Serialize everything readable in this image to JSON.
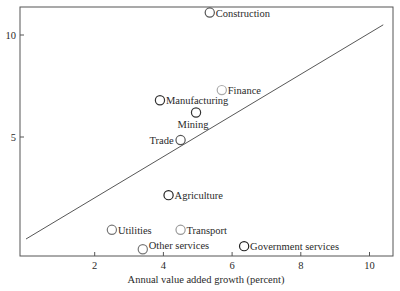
{
  "chart_data": {
    "type": "scatter",
    "title": "",
    "xlabel": "Annual value added growth (percent)",
    "ylabel": "",
    "xlim": [
      0,
      11
    ],
    "ylim": [
      -0.8,
      11.5
    ],
    "x_ticks": [
      2,
      4,
      6,
      8,
      10
    ],
    "y_ticks": [
      5,
      10
    ],
    "grid": false,
    "legend": null,
    "points": [
      {
        "label": "Construction",
        "x": 5.35,
        "y": 11.1,
        "shade": "#555555"
      },
      {
        "label": "Finance",
        "x": 5.7,
        "y": 7.3,
        "shade": "#aaaaaa"
      },
      {
        "label": "Manufacturing",
        "x": 3.9,
        "y": 6.8,
        "shade": "#333333"
      },
      {
        "label": "Mining",
        "x": 4.95,
        "y": 6.2,
        "shade": "#333333"
      },
      {
        "label": "Trade",
        "x": 4.5,
        "y": 4.85,
        "shade": "#555555"
      },
      {
        "label": "Agriculture",
        "x": 4.15,
        "y": 2.15,
        "shade": "#222222"
      },
      {
        "label": "Utilities",
        "x": 2.5,
        "y": 0.45,
        "shade": "#777777"
      },
      {
        "label": "Transport",
        "x": 4.5,
        "y": 0.45,
        "shade": "#999999"
      },
      {
        "label": "Other services",
        "x": 3.4,
        "y": -0.5,
        "shade": "#777777"
      },
      {
        "label": "Government services",
        "x": 6.35,
        "y": -0.35,
        "shade": "#222222"
      }
    ],
    "reference_line": {
      "type": "45-degree",
      "x0": 0,
      "y0": 0,
      "x1": 10.4,
      "y1": 10.5
    }
  }
}
